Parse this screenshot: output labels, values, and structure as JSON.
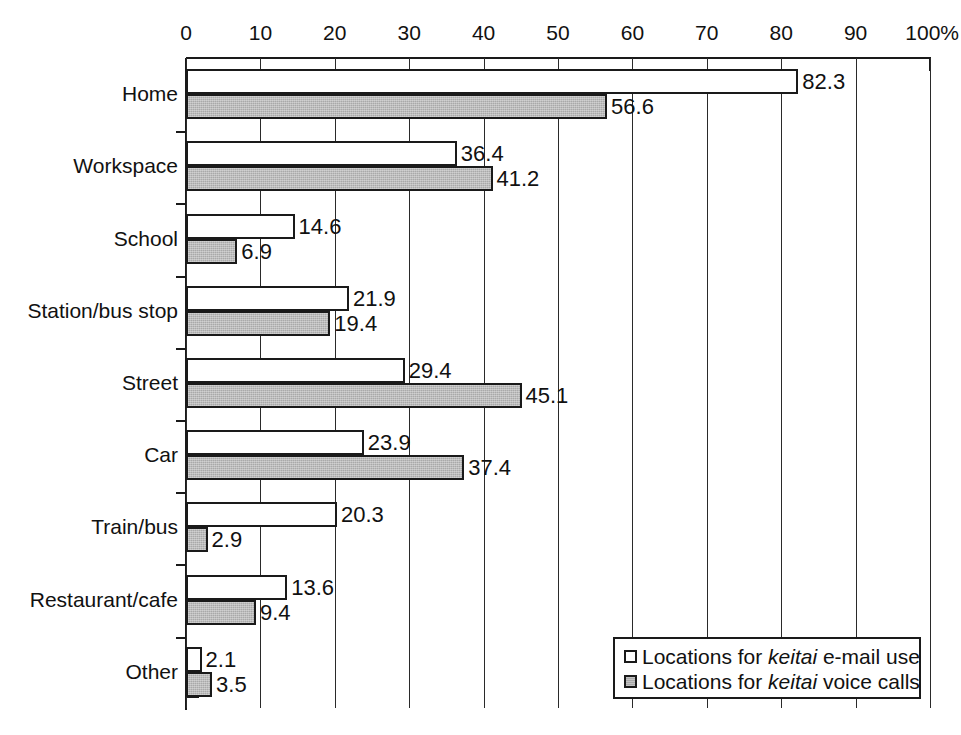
{
  "chart_data": {
    "type": "bar",
    "orientation": "horizontal",
    "title": "",
    "xlabel": "",
    "ylabel": "",
    "xlim": [
      0,
      100
    ],
    "x_unit": "%",
    "grid": true,
    "axis_position": "top",
    "legend_position": "bottom-right",
    "categories": [
      "Home",
      "Workspace",
      "School",
      "Station/bus stop",
      "Street",
      "Car",
      "Train/bus",
      "Restaurant/cafe",
      "Other"
    ],
    "tick_labels": [
      "0",
      "10",
      "20",
      "30",
      "40",
      "50",
      "60",
      "70",
      "80",
      "90",
      "100%"
    ],
    "tick_values": [
      0,
      10,
      20,
      30,
      40,
      50,
      60,
      70,
      80,
      90,
      100
    ],
    "series": [
      {
        "name": "Locations for keitai e-mail use",
        "name_prefix": "Locations for ",
        "name_italic": "keitai",
        "name_suffix": " e-mail use",
        "fill": "#ffffff",
        "values": [
          82.3,
          36.4,
          14.6,
          21.9,
          29.4,
          23.9,
          20.3,
          13.6,
          2.1
        ]
      },
      {
        "name": "Locations for keitai voice calls",
        "name_prefix": "Locations for ",
        "name_italic": "keitai",
        "name_suffix": " voice calls",
        "fill": "#a9a9a9",
        "values": [
          56.6,
          41.2,
          6.9,
          19.4,
          45.1,
          37.4,
          2.9,
          9.4,
          3.5
        ]
      }
    ],
    "colors": {
      "axis": "#1a1a1a",
      "grid": "#2a2a2a",
      "series_email": "#ffffff",
      "series_voice": "#a9a9a9",
      "text": "#111111",
      "background": "#ffffff"
    }
  }
}
